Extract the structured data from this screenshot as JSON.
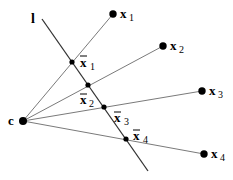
{
  "diagram": {
    "line_label": "l",
    "center_label": "c",
    "points": [
      {
        "label": "x",
        "sub": "1",
        "bar_label": "x",
        "bar_sub": "1"
      },
      {
        "label": "x",
        "sub": "2",
        "bar_label": "x",
        "bar_sub": "2"
      },
      {
        "label": "x",
        "sub": "3",
        "bar_label": "x",
        "bar_sub": "3"
      },
      {
        "label": "x",
        "sub": "4",
        "bar_label": "x",
        "bar_sub": "4"
      }
    ],
    "colors": {
      "ray": "#7a7a7a",
      "line": "#333333",
      "point": "#000000"
    }
  }
}
